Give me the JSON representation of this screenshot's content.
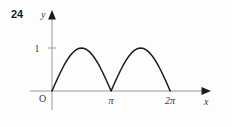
{
  "figure": {
    "problem_number": "24",
    "axis_x_label": "x",
    "axis_y_label": "y",
    "origin_label": "O",
    "y_tick_label": "1",
    "x_tick_labels": [
      "π",
      "2π"
    ],
    "curve_color": "#1a1a1a",
    "axis_color": "#9a9a9a",
    "text_color": "#3a3a3a",
    "background_color": "#fdfdfd"
  },
  "chart_data": {
    "type": "line",
    "title": "",
    "xlabel": "x",
    "ylabel": "y",
    "function": "y = |sin x|",
    "xlim": [
      0,
      7.33
    ],
    "ylim": [
      0,
      1.45
    ],
    "grid": false,
    "legend": null,
    "x_ticks": [
      3.14159265,
      6.28318531
    ],
    "x_tick_labels": [
      "π",
      "2π"
    ],
    "y_ticks": [
      1
    ],
    "y_tick_labels": [
      "1"
    ],
    "series": [
      {
        "name": "|sin x|",
        "x": [
          0,
          0.15708,
          0.31416,
          0.47124,
          0.62832,
          0.7854,
          0.94248,
          1.09956,
          1.25664,
          1.41372,
          1.5708,
          1.72788,
          1.88496,
          2.04204,
          2.19911,
          2.35619,
          2.51327,
          2.67035,
          2.82743,
          2.98451,
          3.14159,
          3.29867,
          3.45575,
          3.61283,
          3.76991,
          3.92699,
          4.08407,
          4.24115,
          4.39823,
          4.55531,
          4.71239,
          4.86947,
          5.02655,
          5.18363,
          5.34071,
          5.49779,
          5.65487,
          5.81195,
          5.96903,
          6.12611,
          6.28319
        ],
        "y": [
          0,
          0.1564,
          0.309,
          0.454,
          0.5878,
          0.7071,
          0.809,
          0.891,
          0.951,
          0.9877,
          1.0,
          0.9877,
          0.951,
          0.891,
          0.809,
          0.7071,
          0.5878,
          0.454,
          0.309,
          0.1564,
          0,
          0.1564,
          0.309,
          0.454,
          0.5878,
          0.7071,
          0.809,
          0.891,
          0.951,
          0.9877,
          1.0,
          0.9877,
          0.951,
          0.891,
          0.809,
          0.7071,
          0.5878,
          0.454,
          0.309,
          0.1564,
          0
        ]
      }
    ],
    "annotations": [
      {
        "text": "O",
        "x": 0,
        "y": 0,
        "role": "origin-label"
      }
    ]
  }
}
